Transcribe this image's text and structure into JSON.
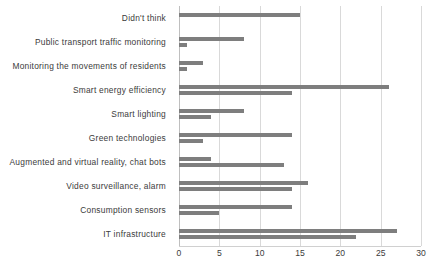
{
  "chart_data": {
    "type": "bar",
    "orientation": "horizontal",
    "title": "",
    "subtitle": "",
    "xlabel": "",
    "ylabel": "",
    "xlim": [
      0,
      30
    ],
    "xticks": [
      0,
      5,
      10,
      15,
      20,
      25,
      30
    ],
    "xtick_labels": [
      "0",
      "5",
      "10",
      "15",
      "20",
      "25",
      "30"
    ],
    "grid": true,
    "grid_axis": "x",
    "legend": false,
    "legend_position": "none",
    "bar_color": "#7e7e7e",
    "categories": [
      "Didn't think",
      "Public transport traffic monitoring",
      "Monitoring the movements of residents",
      "Smart energy efficiency",
      "Smart lighting",
      "Green technologies",
      "Augmented and virtual reality, chat bots",
      "Video surveillance, alarm",
      "Consumption sensors",
      "IT infrastructure"
    ],
    "series": [
      {
        "name": "Series 1",
        "values": [
          15,
          8,
          3,
          26,
          8,
          14,
          4,
          16,
          14,
          27
        ]
      },
      {
        "name": "Series 2",
        "values": [
          0,
          1,
          1,
          14,
          4,
          3,
          13,
          14,
          5,
          22
        ]
      }
    ]
  }
}
